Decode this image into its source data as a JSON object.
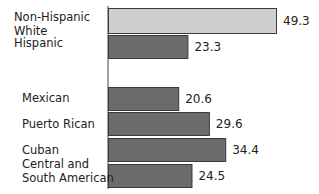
{
  "chart_data": {
    "type": "bar",
    "orientation": "horizontal",
    "title": "",
    "xlabel": "",
    "ylabel": "",
    "categories": [
      "Non-Hispanic White",
      "Hispanic",
      "Mexican",
      "Puerto Rican",
      "Cuban",
      "Central and South American"
    ],
    "category_labels": [
      "Non-Hispanic\nWhite",
      "Hispanic",
      "Mexican",
      "Puerto Rican",
      "Cuban",
      "Central and\nSouth American"
    ],
    "values": [
      49.3,
      23.3,
      20.6,
      29.6,
      34.4,
      24.5
    ],
    "value_labels": [
      "49.3",
      "23.3",
      "20.6",
      "29.6",
      "34.4",
      "24.5"
    ],
    "colors": [
      "#cfcfcf",
      "#6b6b6b",
      "#6b6b6b",
      "#6b6b6b",
      "#6b6b6b",
      "#6b6b6b"
    ],
    "xlim": [
      0,
      49.3
    ],
    "grid": false,
    "legend": "none"
  }
}
